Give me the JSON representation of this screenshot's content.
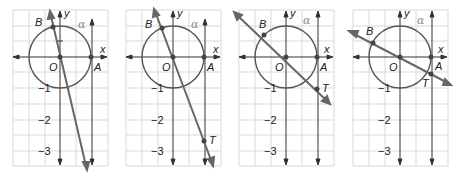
{
  "figure": {
    "colors": {
      "grid": "#d9d9d9",
      "axis": "#333333",
      "circle": "#555555",
      "ray": "#666666",
      "point": "#444444",
      "alpha_label": "#8a8a8a"
    },
    "labels": {
      "x_axis": "x",
      "y_axis": "y",
      "origin": "O",
      "point_a": "A",
      "point_b": "B",
      "point_t": "T",
      "angle": "α"
    },
    "tick_labels": [
      "−1",
      "−2",
      "−3"
    ],
    "panels": [
      {
        "id": 1,
        "b_label": "B",
        "t_label": "",
        "tan_value": -4.5,
        "b_x": -0.22,
        "b_y": 0.97,
        "show_t": false
      },
      {
        "id": 2,
        "b_label": "B",
        "t_label": "T",
        "tan_value": -2.6,
        "b_x": -0.36,
        "b_y": 0.93,
        "show_t": true
      },
      {
        "id": 3,
        "b_label": "B",
        "t_label": "T",
        "tan_value": -1.0,
        "b_x": -0.707,
        "b_y": 0.707,
        "show_t": true
      },
      {
        "id": 4,
        "b_label": "B",
        "t_label": "T",
        "tan_value": -0.55,
        "b_x": -0.88,
        "b_y": 0.48,
        "show_t": true
      }
    ]
  }
}
